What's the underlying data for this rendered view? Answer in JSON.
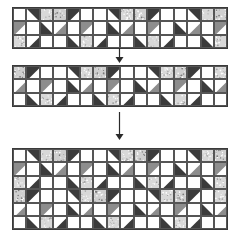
{
  "figure": {
    "kind": "quilt-block-assembly-diagram",
    "title": "",
    "background": "#ffffff",
    "line_color": "#3a3a3a"
  },
  "palette": {
    "white": "#ffffff",
    "dark": "#3b3b3b",
    "medium_gray": "#8d8d8d",
    "light_print": "#d8d8d8",
    "speckle_print": "#cfcfcf",
    "outline": "#555555"
  },
  "geometry": {
    "cell_size": 13.4,
    "strip_columns": 16,
    "strip_rows": 3,
    "result_columns": 16,
    "result_rows": 6,
    "band1": {
      "x": 12,
      "y": 7,
      "w": 214.4,
      "h": 40.2
    },
    "band2": {
      "x": 12,
      "y": 65,
      "w": 214.4,
      "h": 40.2
    },
    "band3": {
      "x": 12,
      "y": 148,
      "w": 214.4,
      "h": 80.4
    }
  },
  "arrows": [
    {
      "name": "arrow-strip1-to-strip2",
      "x": 119,
      "y": 48,
      "length": 15,
      "direction": "down"
    },
    {
      "name": "arrow-strip2-to-result",
      "x": 119,
      "y": 112,
      "length": 28,
      "direction": "down"
    }
  ],
  "bands": [
    {
      "name": "top-strip",
      "label": "Top pieced strip",
      "rows": [
        [
          "w",
          "d2",
          "p1",
          "p2",
          "d1",
          "w",
          "w",
          "d2",
          "p1",
          "p2",
          "d1",
          "w",
          "w",
          "d2",
          "p1",
          "p2"
        ],
        [
          "g1",
          "w",
          "d3",
          "g4",
          "w",
          "g1",
          "w",
          "d3",
          "g4",
          "w",
          "g1",
          "w",
          "d3",
          "g4",
          "w",
          "g1"
        ],
        [
          "p3",
          "d4",
          "w",
          "w",
          "d3",
          "p3",
          "d4",
          "w",
          "w",
          "d3",
          "p3",
          "d4",
          "w",
          "w",
          "d3",
          "p3"
        ]
      ]
    },
    {
      "name": "middle-strip",
      "label": "Second pieced strip",
      "rows": [
        [
          "p2",
          "d1",
          "w",
          "w",
          "d2",
          "p1",
          "p2",
          "d1",
          "w",
          "w",
          "d2",
          "p1",
          "p2",
          "d1",
          "w",
          "p1"
        ],
        [
          "g4",
          "w",
          "g1",
          "w",
          "d3",
          "g4",
          "w",
          "g1",
          "w",
          "d3",
          "g4",
          "w",
          "g1",
          "w",
          "d3",
          "g4"
        ],
        [
          "w",
          "d3",
          "p3",
          "d4",
          "w",
          "w",
          "d3",
          "p3",
          "d4",
          "w",
          "w",
          "d3",
          "p3",
          "d4",
          "w",
          "w"
        ]
      ]
    },
    {
      "name": "joined-block-strip",
      "label": "Joined six-row star strip",
      "rows": [
        [
          "w",
          "d2",
          "p1",
          "p2",
          "d1",
          "w",
          "w",
          "d2",
          "p1",
          "p2",
          "d1",
          "w",
          "w",
          "d2",
          "p1",
          "p2"
        ],
        [
          "g1",
          "w",
          "d3",
          "g4",
          "w",
          "g1",
          "w",
          "d3",
          "g4",
          "w",
          "g1",
          "w",
          "d3",
          "g4",
          "w",
          "g1"
        ],
        [
          "p3",
          "d4",
          "w",
          "w",
          "d3",
          "p3",
          "d4",
          "w",
          "w",
          "d3",
          "p3",
          "d4",
          "w",
          "w",
          "d3",
          "p3"
        ],
        [
          "p2",
          "d1",
          "w",
          "w",
          "d2",
          "p1",
          "p2",
          "d1",
          "w",
          "w",
          "d2",
          "p1",
          "p2",
          "d1",
          "w",
          "p1"
        ],
        [
          "g4",
          "w",
          "g1",
          "w",
          "d3",
          "g4",
          "w",
          "g1",
          "w",
          "d3",
          "g4",
          "w",
          "g1",
          "w",
          "d3",
          "g4"
        ],
        [
          "w",
          "d3",
          "p3",
          "d4",
          "w",
          "w",
          "d3",
          "p3",
          "d4",
          "w",
          "w",
          "d3",
          "p3",
          "d4",
          "w",
          "w"
        ]
      ]
    }
  ],
  "patch_legend": {
    "w": "plain white square",
    "d1": "dark half-square triangle, top-left",
    "d2": "dark half-square triangle, top-right",
    "d3": "dark half-square triangle, bottom-left",
    "d4": "dark half-square triangle, bottom-right",
    "g1": "medium gray half-square triangle, top-left",
    "g4": "medium gray half-square triangle, bottom-right",
    "p1": "light print square",
    "p2": "speckled print square",
    "p3": "light print square"
  }
}
